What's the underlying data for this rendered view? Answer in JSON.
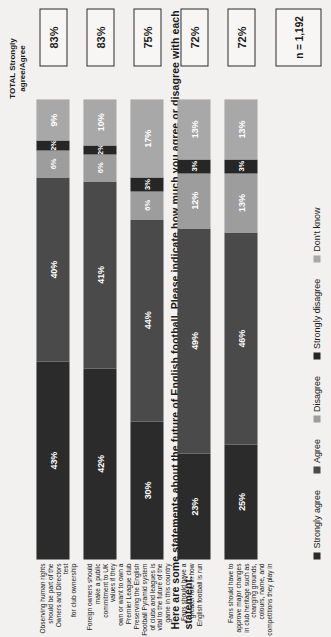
{
  "title": "Here are some statements about the future of English football.  Please indicate how much you agree or disagree with each statement:",
  "total_header_line1": "TOTAL Strongly",
  "total_header_line2": "agree/Agree",
  "base_note": "n = 1,192",
  "colors": {
    "strongly_agree": "#2b2b2b",
    "agree": "#4a4a4a",
    "disagree": "#9d9d9d",
    "strongly_disagree": "#262626",
    "dont_know": "#a8a8a8",
    "box_border": "#2a2a2a",
    "background": "#f2f1ef"
  },
  "legend": [
    {
      "label": "Strongly agree",
      "color": "#2b2b2b"
    },
    {
      "label": "Agree",
      "color": "#4a4a4a"
    },
    {
      "label": "Disagree",
      "color": "#9d9d9d"
    },
    {
      "label": "Strongly disagree",
      "color": "#262626"
    },
    {
      "label": "Don't know",
      "color": "#a8a8a8"
    }
  ],
  "chart_data": {
    "type": "bar",
    "title": "Here are some statements about the future of English football.  Please indicate how much you agree or disagree with each statement:",
    "xlabel": "",
    "ylabel": "",
    "xlim": [
      0,
      100
    ],
    "grid": false,
    "legend_position": "bottom",
    "stacked": true,
    "orientation": "horizontal",
    "categories": [
      "Observing human rights should be part of the Owners and Directors test for club ownership",
      "Foreign owners should make a public commitment to UK values if they own or want to own a Premier League club",
      "Preserving the English Football Pyramid system of clubs and leagues is vital to the future of the game in this country",
      "Fans should have a greater role in how English football is run",
      "Fans should have to approve major changes in club heritage such as changing grounds, colours, name, and competitions they play in"
    ],
    "category_lines": [
      [
        "Observing human rights should be part of the Owners and Directors test",
        "for club ownership"
      ],
      [
        "Foreign owners should make a public commitment to UK values if they",
        "own or want to own a Premier League club"
      ],
      [
        "Preserving the English Football Pyramid system of clubs and leagues is",
        "vital to the future of the game in this country"
      ],
      [
        "Fans should have a greater role in how English football is run",
        ""
      ],
      [
        "Fans should have to approve major changes in club heritage such as",
        "changing grounds, colours, name, and competitions they play in"
      ]
    ],
    "series": [
      {
        "name": "Strongly agree",
        "values": [
          43,
          42,
          30,
          23,
          25
        ]
      },
      {
        "name": "Agree",
        "values": [
          40,
          41,
          44,
          49,
          46
        ]
      },
      {
        "name": "Disagree",
        "values": [
          6,
          6,
          6,
          12,
          13
        ]
      },
      {
        "name": "Strongly disagree",
        "values": [
          2,
          2,
          3,
          3,
          3
        ]
      },
      {
        "name": "Don't know",
        "values": [
          9,
          10,
          17,
          13,
          13
        ]
      }
    ],
    "totals": [
      "83%",
      "83%",
      "75%",
      "72%",
      "72%"
    ],
    "base": "n = 1,192"
  },
  "rows": [
    {
      "total": "83%",
      "segments": [
        {
          "name": "Strongly agree",
          "label": "43%",
          "value": 43
        },
        {
          "name": "Agree",
          "label": "40%",
          "value": 40
        },
        {
          "name": "Disagree",
          "label": "6%",
          "value": 6
        },
        {
          "name": "Strongly disagree",
          "label": "2%",
          "value": 2
        },
        {
          "name": "Don't know",
          "label": "9%",
          "value": 9
        }
      ]
    },
    {
      "total": "83%",
      "segments": [
        {
          "name": "Strongly agree",
          "label": "42%",
          "value": 42
        },
        {
          "name": "Agree",
          "label": "41%",
          "value": 41
        },
        {
          "name": "Disagree",
          "label": "6%",
          "value": 6
        },
        {
          "name": "Strongly disagree",
          "label": "2%",
          "value": 2
        },
        {
          "name": "Don't know",
          "label": "10%",
          "value": 10
        }
      ]
    },
    {
      "total": "75%",
      "segments": [
        {
          "name": "Strongly agree",
          "label": "30%",
          "value": 30
        },
        {
          "name": "Agree",
          "label": "44%",
          "value": 44
        },
        {
          "name": "Disagree",
          "label": "6%",
          "value": 6
        },
        {
          "name": "Strongly disagree",
          "label": "3%",
          "value": 3
        },
        {
          "name": "Don't know",
          "label": "17%",
          "value": 17
        }
      ]
    },
    {
      "total": "72%",
      "segments": [
        {
          "name": "Strongly agree",
          "label": "23%",
          "value": 23
        },
        {
          "name": "Agree",
          "label": "49%",
          "value": 49
        },
        {
          "name": "Disagree",
          "label": "12%",
          "value": 12
        },
        {
          "name": "Strongly disagree",
          "label": "3%",
          "value": 3
        },
        {
          "name": "Don't know",
          "label": "13%",
          "value": 13
        }
      ]
    },
    {
      "total": "72%",
      "segments": [
        {
          "name": "Strongly agree",
          "label": "25%",
          "value": 25
        },
        {
          "name": "Agree",
          "label": "46%",
          "value": 46
        },
        {
          "name": "Disagree",
          "label": "13%",
          "value": 13
        },
        {
          "name": "Strongly disagree",
          "label": "3%",
          "value": 3
        },
        {
          "name": "Don't know",
          "label": "13%",
          "value": 13
        }
      ]
    }
  ]
}
